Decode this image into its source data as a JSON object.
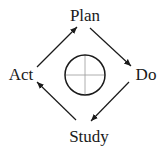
{
  "diagram": {
    "type": "cycle",
    "nodes": [
      {
        "id": "plan",
        "label": "Plan",
        "x": 85,
        "y": 21
      },
      {
        "id": "do",
        "label": "Do",
        "x": 146,
        "y": 80
      },
      {
        "id": "study",
        "label": "Study",
        "x": 89,
        "y": 142
      },
      {
        "id": "act",
        "label": "Act",
        "x": 21,
        "y": 80
      }
    ],
    "edges": [
      {
        "from": "act",
        "to": "plan"
      },
      {
        "from": "plan",
        "to": "do"
      },
      {
        "from": "do",
        "to": "study"
      },
      {
        "from": "study",
        "to": "act"
      }
    ],
    "center_symbol": "circle-with-crosshair",
    "colors": {
      "stroke": "#1a1a1a",
      "crosshair": "#999999",
      "background": "#ffffff"
    }
  }
}
